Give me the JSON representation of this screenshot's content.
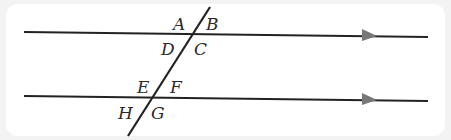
{
  "diagram": {
    "type": "parallel-lines-cut-by-transversal",
    "colors": {
      "background": "#f3f3f3",
      "panel": "#ffffff",
      "line": "#222222",
      "arrow": "#777777",
      "label": "#2a2a2a"
    },
    "lines": [
      {
        "name": "top-parallel-line",
        "x1": 24,
        "y1": 32,
        "x2": 428,
        "y2": 37,
        "arrow_x": 368
      },
      {
        "name": "bottom-parallel-line",
        "x1": 24,
        "y1": 96,
        "x2": 428,
        "y2": 101,
        "arrow_x": 368
      },
      {
        "name": "transversal",
        "x1": 210,
        "y1": 7,
        "x2": 128,
        "y2": 136
      }
    ],
    "angle_labels": {
      "A": "A",
      "B": "B",
      "C": "C",
      "D": "D",
      "E": "E",
      "F": "F",
      "G": "G",
      "H": "H"
    }
  }
}
